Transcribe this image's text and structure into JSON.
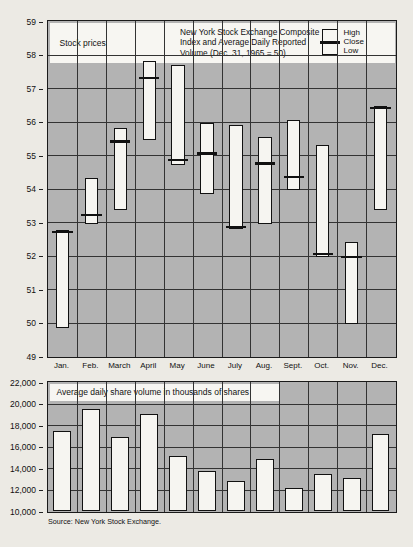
{
  "chart_data": [
    {
      "type": "bar",
      "subtype": "ohlc-range",
      "title": "New York Stock Exchange Composite Index and Average Daily Reported Volume (Dec. 31, 1965 = 50)",
      "panel_label": "Stock prices",
      "xlabel": "",
      "ylabel": "",
      "ylim": [
        49,
        59
      ],
      "yticks": [
        49,
        50,
        51,
        52,
        53,
        54,
        55,
        56,
        57,
        58,
        59
      ],
      "ytick_labels": [
        "49",
        "50",
        "51",
        "52",
        "53",
        "54",
        "55",
        "56",
        "57",
        "58",
        "59"
      ],
      "grid": true,
      "legend": [
        "High",
        "Close",
        "Low"
      ],
      "legend_position": "top-right",
      "categories": [
        "Jan.",
        "Feb.",
        "March",
        "April",
        "May",
        "June",
        "July",
        "Aug.",
        "Sept.",
        "Oct.",
        "Nov.",
        "Dec."
      ],
      "series": [
        {
          "name": "High",
          "values": [
            52.75,
            54.3,
            55.8,
            57.8,
            57.7,
            55.95,
            55.9,
            55.55,
            56.05,
            55.3,
            52.4,
            56.45
          ]
        },
        {
          "name": "Close",
          "values": [
            52.7,
            53.2,
            55.4,
            57.3,
            54.85,
            55.05,
            52.85,
            54.75,
            54.35,
            52.05,
            51.95,
            56.4
          ]
        },
        {
          "name": "Low",
          "values": [
            49.85,
            52.95,
            53.35,
            55.45,
            54.7,
            53.85,
            52.8,
            52.95,
            53.95,
            51.95,
            49.95,
            53.35
          ]
        }
      ]
    },
    {
      "type": "bar",
      "title": "Average daily share volume in thousands of shares",
      "xlabel": "",
      "ylabel": "",
      "ylim": [
        10000,
        22000
      ],
      "yticks": [
        10000,
        12000,
        14000,
        16000,
        18000,
        20000,
        22000
      ],
      "ytick_labels": [
        "10,000",
        "12,000",
        "14,000",
        "16,000",
        "18,000",
        "20,000",
        "22,000"
      ],
      "grid": true,
      "categories": [
        "Jan.",
        "Feb.",
        "March",
        "April",
        "May",
        "June",
        "July",
        "Aug.",
        "Sept.",
        "Oct.",
        "Nov.",
        "Dec."
      ],
      "values": [
        17400,
        19450,
        16850,
        19000,
        15100,
        13700,
        12800,
        14850,
        12100,
        13400,
        13050,
        17200
      ]
    }
  ],
  "figure": {
    "price_panel": {
      "label": "Stock prices",
      "title_line_1": "New York Stock Exchange Composite",
      "title_line_2": "Index and Average Daily Reported",
      "title_line_3": "Volume (Dec. 31, 1965 = 50)",
      "legend": {
        "high": "High",
        "close": "Close",
        "low": "Low"
      }
    },
    "volume_panel": {
      "title": "Average daily share volume in thousands of shares"
    },
    "source": "Source: New York Stock Exchange."
  },
  "colors": {
    "plot_background": "#b3b3b3",
    "bar_fill": "#f6f5f1",
    "ink": "#111111",
    "page_background": "#eceae4"
  }
}
